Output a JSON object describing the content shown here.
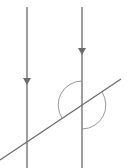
{
  "diagram": {
    "type": "geometry",
    "colors": {
      "line": "#6b6b6b",
      "arc": "#8a8a8a",
      "background": "#ffffff"
    },
    "parallel_lines": [
      {
        "id": "left",
        "x": 27,
        "y1": 7,
        "y2": 168,
        "arrow_y": 80,
        "arrow_direction": "down"
      },
      {
        "id": "right",
        "x": 82,
        "y1": 7,
        "y2": 168,
        "arrow_y": 50,
        "arrow_direction": "down"
      }
    ],
    "transversal": {
      "x1": 0,
      "y1": 160,
      "x2": 121,
      "y2": 79
    },
    "intersection": {
      "x": 82,
      "y": 105
    },
    "angle_arcs": [
      {
        "id": "upper-left-angle",
        "radius": 24
      },
      {
        "id": "lower-right-angle",
        "radius": 24
      }
    ]
  }
}
